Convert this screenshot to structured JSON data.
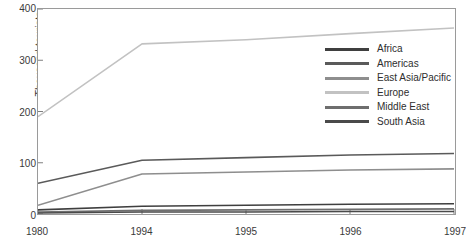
{
  "chart_data": {
    "type": "line",
    "title": "",
    "xlabel": "",
    "ylabel": "Thousand tourists",
    "categories": [
      "1980",
      "1994",
      "1995",
      "1996",
      "1997"
    ],
    "ylim": [
      0,
      400
    ],
    "yticks": [
      0,
      100,
      200,
      300,
      400
    ],
    "grid": false,
    "legend_position": "inside upper-right",
    "series": [
      {
        "name": "Africa",
        "color": "#3f3f3f",
        "values": [
          8,
          15,
          17,
          19,
          20
        ]
      },
      {
        "name": "Americas",
        "color": "#5a5a5a",
        "values": [
          60,
          105,
          110,
          115,
          118
        ]
      },
      {
        "name": "East Asia/Pacific",
        "color": "#8e8e8e",
        "values": [
          17,
          78,
          82,
          86,
          88
        ]
      },
      {
        "name": "Europe",
        "color": "#c2c2c2",
        "values": [
          190,
          332,
          340,
          352,
          363
        ]
      },
      {
        "name": "Middle East",
        "color": "#6e6e6e",
        "values": [
          4,
          7,
          8,
          9,
          10
        ]
      },
      {
        "name": "South Asia",
        "color": "#4a4a4a",
        "values": [
          2,
          4,
          4,
          5,
          5
        ]
      }
    ]
  },
  "axis": {
    "y_title": "Thousand tourists",
    "y_tick_labels": [
      "0",
      "100",
      "200",
      "300",
      "400"
    ],
    "x_tick_labels": [
      "1980",
      "1994",
      "1995",
      "1996",
      "1997"
    ]
  }
}
